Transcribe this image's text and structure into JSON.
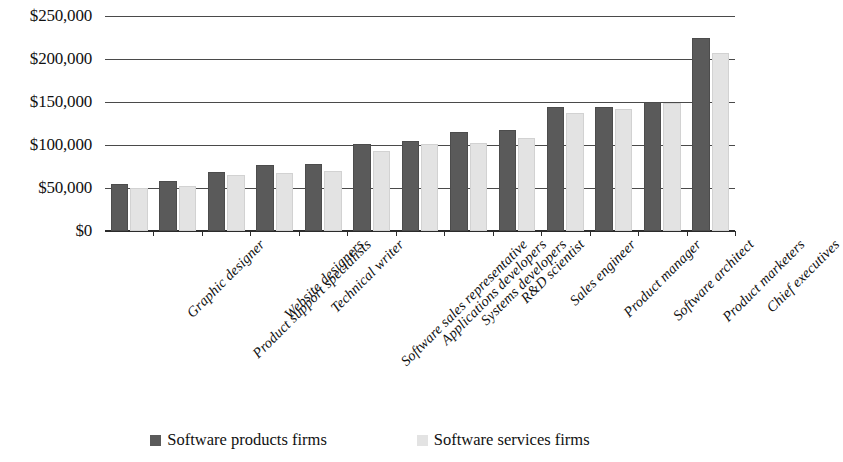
{
  "chart_data": {
    "type": "bar",
    "title": "",
    "subtitle": "",
    "xlabel": "",
    "ylabel": "",
    "ylim": [
      0,
      250000
    ],
    "ytick_step": 50000,
    "ytick_labels": [
      "$0",
      "$50,000",
      "$100,000",
      "$150,000",
      "$200,000",
      "$250,000"
    ],
    "ytick_values": [
      0,
      50000,
      100000,
      150000,
      200000,
      250000
    ],
    "grid": true,
    "legend_position": "bottom",
    "categories": [
      "Graphic designer",
      "Product support specialists",
      "Website designers",
      "Technical writer",
      "Software sales representative",
      "Applications developers",
      "Systems developers",
      "R&D scientist",
      "Sales engineer",
      "Product manager",
      "Software architect",
      "Product marketers",
      "Chief executives"
    ],
    "series": [
      {
        "name": "Software products firms",
        "color": "#5a5a5a",
        "values": [
          55000,
          58000,
          69000,
          77000,
          78000,
          101000,
          105000,
          115000,
          117000,
          144000,
          144000,
          150000,
          224000
        ]
      },
      {
        "name": "Software services firms",
        "color": "#e3e3e3",
        "values": [
          50000,
          52000,
          65000,
          68000,
          70000,
          93000,
          101000,
          102000,
          108000,
          137000,
          142000,
          149000,
          207000
        ]
      }
    ]
  },
  "legend": {
    "items": [
      {
        "label": "Software products firms",
        "swatch": "legend-swatch-dark"
      },
      {
        "label": "Software services firms",
        "swatch": "legend-swatch-light"
      }
    ]
  }
}
